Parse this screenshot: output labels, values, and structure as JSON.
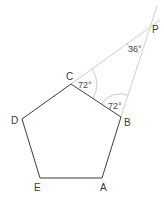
{
  "diagram": {
    "type": "geometry",
    "shape": "regular pentagon with extended sides meeting at external point",
    "vertices": {
      "A": {
        "label": "A",
        "x": 102,
        "y": 178
      },
      "B": {
        "label": "B",
        "x": 121,
        "y": 117
      },
      "C": {
        "label": "C",
        "x": 71,
        "y": 84
      },
      "D": {
        "label": "D",
        "x": 22,
        "y": 119
      },
      "E": {
        "label": "E",
        "x": 40,
        "y": 178
      },
      "P": {
        "label": "P",
        "x": 147,
        "y": 28
      }
    },
    "angles": {
      "at_C": {
        "label": "72°",
        "vertex": "C"
      },
      "at_B": {
        "label": "72°",
        "vertex": "B"
      },
      "at_P": {
        "label": "36°",
        "vertex": "P"
      }
    },
    "colors": {
      "pentagon_stroke": "#3c3c3c",
      "construction_stroke": "#c8c8c8",
      "text": "#3a3a3a"
    }
  }
}
